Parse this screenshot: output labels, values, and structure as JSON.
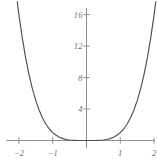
{
  "chart_data": {
    "type": "line",
    "title": "",
    "subtitle": "",
    "xlabel": "",
    "ylabel": "",
    "function": "y = x^4",
    "xlim": [
      -2.25,
      2.25
    ],
    "ylim": [
      -1.0,
      17.6
    ],
    "grid": false,
    "legend": null,
    "axes_style": "crossed-axes-at-origin",
    "x_ticks": [
      -2,
      -1,
      1,
      2
    ],
    "x_tick_labels": [
      "−2",
      "−1",
      "1",
      "2"
    ],
    "y_ticks": [
      4,
      8,
      12,
      16
    ],
    "y_tick_labels": [
      "4",
      "8",
      "12",
      "16"
    ],
    "series": [
      {
        "name": "y = x^4",
        "color": "#4e4e54",
        "x": [
          -2.05,
          -2.0,
          -1.9,
          -1.8,
          -1.7,
          -1.6,
          -1.5,
          -1.4,
          -1.3,
          -1.2,
          -1.1,
          -1.0,
          -0.9,
          -0.8,
          -0.7,
          -0.6,
          -0.5,
          -0.4,
          -0.3,
          -0.2,
          -0.1,
          0.0,
          0.1,
          0.2,
          0.3,
          0.4,
          0.5,
          0.6,
          0.7,
          0.8,
          0.9,
          1.0,
          1.1,
          1.2,
          1.3,
          1.4,
          1.5,
          1.6,
          1.7,
          1.8,
          1.9,
          2.0,
          2.05
        ],
        "y": [
          17.66,
          16.0,
          13.03,
          10.49,
          8.35,
          6.55,
          5.06,
          3.84,
          2.86,
          2.07,
          1.46,
          1.0,
          0.66,
          0.41,
          0.24,
          0.13,
          0.06,
          0.03,
          0.01,
          0.0,
          0.0,
          0.0,
          0.0,
          0.0,
          0.01,
          0.03,
          0.06,
          0.13,
          0.24,
          0.41,
          0.66,
          1.0,
          1.46,
          2.07,
          2.86,
          3.84,
          5.06,
          6.55,
          8.35,
          10.49,
          13.03,
          16.0,
          17.66
        ]
      }
    ],
    "colors": {
      "curve": "#4e4e54",
      "axis": "#8e8e93",
      "tick_label": "#6f6f74",
      "background": "#ffffff"
    }
  },
  "axes": {
    "x_axis_name": "x-axis",
    "y_axis_name": "y-axis"
  }
}
